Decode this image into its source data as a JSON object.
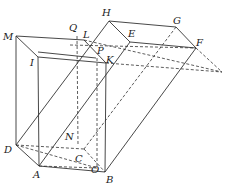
{
  "figure": {
    "type": "geometry-diagram",
    "labels": {
      "M": "M",
      "Q": "Q",
      "L": "L",
      "H": "H",
      "E": "E",
      "G": "G",
      "F": "F",
      "I": "I",
      "P": "P",
      "K": "K",
      "N": "N",
      "D": "D",
      "C": "C",
      "A": "A",
      "O": "O",
      "B": "B"
    },
    "colors": {
      "line": "#333333",
      "background": "#ffffff"
    }
  }
}
